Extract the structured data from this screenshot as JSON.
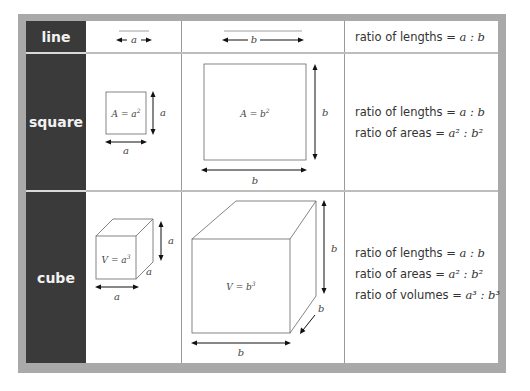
{
  "colors": {
    "frame": "#a9a9a9",
    "header_column": "#3a3a3a",
    "header_text": "#f2f2f2",
    "cell_background": "#ffffff",
    "figure_stroke": "#555555",
    "arrow": "#1a1a1a"
  },
  "rows": [
    {
      "header": "line",
      "small_figure": {
        "shape": "line",
        "label": "a"
      },
      "large_figure": {
        "shape": "line",
        "label": "b"
      },
      "ratios": [
        {
          "label": "ratio of lengths",
          "eq": "=",
          "value": "a : b"
        }
      ]
    },
    {
      "header": "square",
      "small_figure": {
        "shape": "square",
        "formula": "A = a²",
        "side_label": "a",
        "bottom_label": "a"
      },
      "large_figure": {
        "shape": "square",
        "formula": "A = b²",
        "side_label": "b",
        "bottom_label": "b"
      },
      "ratios": [
        {
          "label": "ratio of lengths",
          "eq": "=",
          "value": "a : b"
        },
        {
          "label": "ratio of areas",
          "eq": "=",
          "value": "a² : b²"
        }
      ]
    },
    {
      "header": "cube",
      "small_figure": {
        "shape": "cube",
        "formula": "V = a³",
        "side_label": "a",
        "depth_label": "a",
        "bottom_label": "a"
      },
      "large_figure": {
        "shape": "cube",
        "formula": "V = b³",
        "side_label": "b",
        "depth_label": "b",
        "bottom_label": "b"
      },
      "ratios": [
        {
          "label": "ratio of lengths",
          "eq": "=",
          "value": "a : b"
        },
        {
          "label": "ratio of areas",
          "eq": "=",
          "value": "a² : b²"
        },
        {
          "label": "ratio of volumes",
          "eq": "=",
          "value": "a³ : b³"
        }
      ]
    }
  ]
}
